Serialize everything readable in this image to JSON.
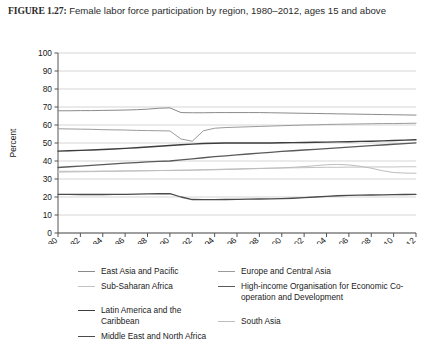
{
  "caption": {
    "figure_number": "FIGURE 1.27:",
    "text": "Female labor force participation by region, 1980–2012, ages 15 and above"
  },
  "chart_data": {
    "type": "line",
    "title": "Female labor force participation by region, 1980–2012, ages 15 and above",
    "xlabel": "",
    "ylabel": "Percent",
    "ylim": [
      0,
      100
    ],
    "ytick_step": 10,
    "yticks": [
      0,
      10,
      20,
      30,
      40,
      50,
      60,
      70,
      80,
      90,
      100
    ],
    "grid": "horizontal",
    "legend_position": "bottom",
    "x": [
      1980,
      1981,
      1982,
      1983,
      1984,
      1985,
      1986,
      1987,
      1988,
      1989,
      1990,
      1991,
      1992,
      1993,
      1994,
      1995,
      1996,
      1997,
      1998,
      1999,
      2000,
      2001,
      2002,
      2003,
      2004,
      2005,
      2006,
      2007,
      2008,
      2009,
      2010,
      2011,
      2012
    ],
    "xtick_labels": [
      "1980",
      "1982",
      "1984",
      "1986",
      "1988",
      "1990",
      "1992",
      "1994",
      "1996",
      "1998",
      "2000",
      "2002",
      "2004",
      "2006",
      "2008",
      "2010",
      "2012"
    ],
    "series": [
      {
        "name": "East Asia and Pacific",
        "color": "#8a8a8a",
        "width": 1.0,
        "values": [
          67.9,
          67.9,
          68.0,
          68.0,
          68.1,
          68.2,
          68.3,
          68.5,
          68.8,
          69.3,
          69.5,
          66.9,
          66.8,
          66.8,
          66.9,
          66.9,
          66.9,
          66.9,
          66.9,
          66.8,
          66.7,
          66.6,
          66.5,
          66.4,
          66.3,
          66.2,
          66.1,
          66.0,
          65.9,
          65.8,
          65.7,
          65.6,
          65.5
        ]
      },
      {
        "name": "Europe and Central Asia",
        "color": "#9b9b9b",
        "width": 1.0,
        "values": [
          57.9,
          57.8,
          57.7,
          57.6,
          57.4,
          57.3,
          57.2,
          57.0,
          56.9,
          56.8,
          56.7,
          52.2,
          51.0,
          56.8,
          58.2,
          58.6,
          58.8,
          59.0,
          59.2,
          59.4,
          59.6,
          59.8,
          60.0,
          60.1,
          60.3,
          60.4,
          60.5,
          60.6,
          60.7,
          60.8,
          60.8,
          60.9,
          61.0
        ]
      },
      {
        "name": "Sub-Saharan Africa",
        "color": "#c2c2c2",
        "width": 1.0,
        "values": [
          33.8,
          33.9,
          34.0,
          34.1,
          34.2,
          34.3,
          34.4,
          34.5,
          34.6,
          34.7,
          34.8,
          34.9,
          35.0,
          35.2,
          35.3,
          35.5,
          35.6,
          35.8,
          35.9,
          36.0,
          36.1,
          36.2,
          36.3,
          36.4,
          36.5,
          36.5,
          36.6,
          36.6,
          36.7,
          36.7,
          36.7,
          36.8,
          36.8
        ]
      },
      {
        "name": "High-income Organisation for Economic Co-operation and Development",
        "color": "#5a5a5a",
        "width": 1.3,
        "values": [
          36.4,
          36.8,
          37.2,
          37.6,
          38.0,
          38.4,
          38.8,
          39.1,
          39.5,
          39.8,
          40.0,
          40.6,
          41.2,
          41.8,
          42.4,
          42.9,
          43.4,
          43.9,
          44.4,
          44.8,
          45.3,
          45.7,
          46.1,
          46.5,
          46.9,
          47.3,
          47.7,
          48.1,
          48.5,
          48.9,
          49.3,
          49.7,
          50.1
        ]
      },
      {
        "name": "Latin America and the Caribbean",
        "color": "#3d3d3d",
        "width": 1.4,
        "values": [
          45.5,
          45.7,
          45.9,
          46.1,
          46.4,
          46.7,
          47.0,
          47.4,
          47.8,
          48.2,
          48.6,
          49.0,
          49.4,
          49.7,
          49.9,
          50.0,
          50.0,
          50.0,
          50.0,
          50.0,
          50.1,
          50.2,
          50.3,
          50.4,
          50.5,
          50.6,
          50.7,
          50.9,
          51.0,
          51.2,
          51.4,
          51.6,
          51.8
        ]
      },
      {
        "name": "South Asia",
        "color": "#bdbdbd",
        "width": 1.0,
        "values": [
          34.3,
          34.3,
          34.3,
          34.3,
          34.4,
          34.4,
          34.5,
          34.5,
          34.6,
          34.7,
          34.7,
          34.8,
          34.9,
          35.0,
          35.1,
          35.3,
          35.4,
          35.6,
          35.8,
          36.0,
          36.2,
          36.5,
          36.9,
          37.4,
          37.9,
          38.1,
          37.8,
          37.1,
          36.0,
          34.6,
          33.6,
          33.3,
          33.2
        ]
      },
      {
        "name": "Middle East and North Africa",
        "color": "#4a4a4a",
        "width": 1.3,
        "values": [
          21.5,
          21.5,
          21.4,
          21.4,
          21.4,
          21.5,
          21.5,
          21.6,
          21.7,
          21.8,
          21.9,
          20.0,
          18.6,
          18.5,
          18.5,
          18.6,
          18.7,
          18.8,
          18.9,
          19.0,
          19.1,
          19.3,
          19.6,
          20.0,
          20.4,
          20.7,
          20.9,
          21.0,
          21.1,
          21.2,
          21.3,
          21.4,
          21.5
        ]
      }
    ]
  },
  "legend": {
    "columns": [
      {
        "groups": [
          [
            {
              "label": "East Asia and Pacific",
              "color": "#8a8a8a",
              "width": 1.0
            },
            {
              "label": "Sub-Saharan Africa",
              "color": "#c2c2c2",
              "width": 1.0
            }
          ],
          [
            {
              "label": "Latin America and the Caribbean",
              "color": "#3d3d3d",
              "width": 1.4
            },
            {
              "label": "Middle East and North Africa",
              "color": "#4a4a4a",
              "width": 1.3
            }
          ]
        ]
      },
      {
        "groups": [
          [
            {
              "label": "Europe and Central Asia",
              "color": "#9b9b9b",
              "width": 1.0
            },
            {
              "label": "High-income Organisation for Economic Co-operation and Development",
              "color": "#5a5a5a",
              "width": 1.3
            }
          ],
          [
            {
              "label": "South Asia",
              "color": "#bdbdbd",
              "width": 1.0
            }
          ]
        ]
      }
    ]
  }
}
